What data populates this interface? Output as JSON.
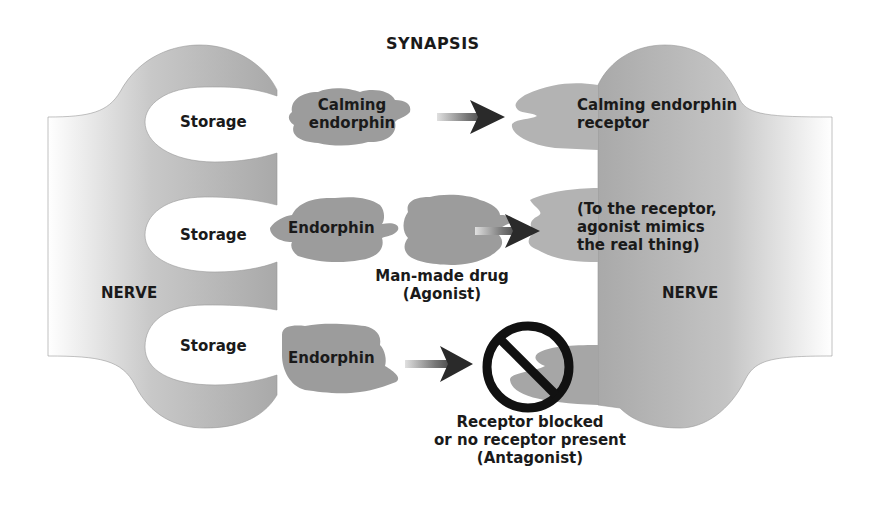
{
  "title": "SYNAPSIS",
  "left_nerve": {
    "label": "NERVE",
    "storage_labels": [
      "Storage",
      "Storage",
      "Storage"
    ]
  },
  "right_nerve": {
    "label": "NERVE"
  },
  "rows": [
    {
      "molecule_label_line1": "Calming",
      "molecule_label_line2": "endorphin",
      "receptor_label_line1": "Calming endorphin",
      "receptor_label_line2": "receptor"
    },
    {
      "molecule_label": "Endorphin",
      "drug_label_line1": "Man-made drug",
      "drug_label_line2": "(Agonist)",
      "receptor_label_line1": "(To the receptor,",
      "receptor_label_line2": "agonist mimics",
      "receptor_label_line3": "the real thing)"
    },
    {
      "molecule_label": "Endorphin",
      "blocked_icon": "no-entry-icon",
      "blocked_label_line1": "Receptor blocked",
      "blocked_label_line2": "or no receptor present",
      "blocked_label_line3": "(Antagonist)"
    }
  ],
  "colors": {
    "nerve_gray": "#b8b8b8",
    "molecule_gray": "#9a9a9a",
    "arrow_dark": "#333333",
    "text": "#1a1a1a"
  }
}
